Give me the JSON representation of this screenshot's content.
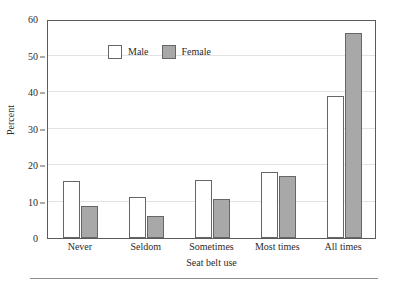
{
  "chart_data": {
    "type": "bar",
    "title": "",
    "xlabel": "Seat belt use",
    "ylabel": "Percent",
    "categories": [
      "Never",
      "Seldom",
      "Sometimes",
      "Most times",
      "All times"
    ],
    "series": [
      {
        "name": "Male",
        "color": "#ffffff",
        "values": [
          15.6,
          11.2,
          15.8,
          18.2,
          39.0
        ]
      },
      {
        "name": "Female",
        "color": "#a8a8a8",
        "values": [
          8.8,
          6.0,
          10.8,
          17.0,
          56.3
        ]
      }
    ],
    "ylim": [
      0,
      60
    ],
    "yticks": [
      0,
      10,
      20,
      30,
      40,
      50,
      60
    ],
    "ytick_labels": [
      "0",
      "10",
      "20",
      "30",
      "40",
      "50",
      "60"
    ],
    "grid": true,
    "grid_axis": "y",
    "legend_position": "top-left",
    "bar_edge_color": "#666666",
    "axis_color": "#5b5b5b",
    "gridline_color": "#e2e2e2"
  },
  "legend": {
    "entries": [
      {
        "label": "Male"
      },
      {
        "label": "Female"
      }
    ]
  }
}
